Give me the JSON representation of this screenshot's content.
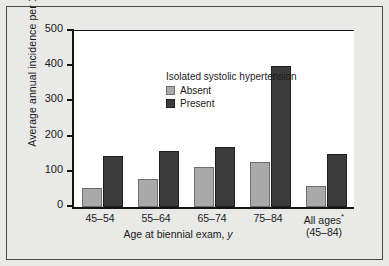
{
  "chart_data": {
    "type": "bar",
    "title": "",
    "xlabel": "Age at biennial exam, y",
    "ylabel": "Average annual incidence per 10,000",
    "categories": [
      "45–54",
      "55–64",
      "65–74",
      "75–84",
      "All ages*"
    ],
    "category_sublabels": [
      "",
      "",
      "",
      "",
      "(45–84)"
    ],
    "ylim": [
      0,
      500
    ],
    "yticks": [
      0,
      100,
      200,
      300,
      400,
      500
    ],
    "ytick_labels": [
      "0",
      "100",
      "200",
      "300",
      "400",
      "500"
    ],
    "grid": false,
    "legend_position": "upper-left-inside",
    "legend_title": "Isolated systolic hypertension",
    "series": [
      {
        "name": "Absent",
        "color": "#a9a9a9",
        "values": [
          55,
          80,
          115,
          128,
          60
        ]
      },
      {
        "name": "Present",
        "color": "#3b3b3b",
        "values": [
          145,
          160,
          170,
          400,
          150
        ]
      }
    ]
  },
  "colors": {
    "figure_background": "#e9e9e7",
    "plot_background": "#ffffff",
    "axis": "#141414",
    "text": "#1a1a1a",
    "absent_bar": "#a9a9a9",
    "present_bar": "#3b3b3b"
  }
}
